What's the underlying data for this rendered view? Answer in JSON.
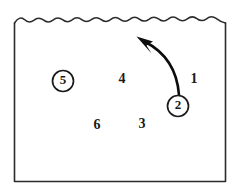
{
  "figure": {
    "type": "line-art-diagram",
    "background_color": "#ffffff",
    "stroke_color": "#2b2b2b",
    "ink_color": "#0d0d0d",
    "frame": {
      "left": 14,
      "right": 226,
      "top": 22,
      "bottom": 182,
      "top_edge_style": "wavy",
      "wave_count": 11,
      "wave_amplitude": 3.5
    },
    "labels": [
      {
        "id": "label-1",
        "text": "1",
        "x": 194,
        "y": 80,
        "circled": false
      },
      {
        "id": "label-3",
        "text": "3",
        "x": 142,
        "y": 125,
        "circled": false
      },
      {
        "id": "label-4",
        "text": "4",
        "x": 122,
        "y": 80,
        "circled": false
      },
      {
        "id": "label-6",
        "text": "6",
        "x": 97,
        "y": 126,
        "circled": false
      }
    ],
    "circled_labels": [
      {
        "id": "circled-label-5",
        "text": "5",
        "cx": 63,
        "cy": 81,
        "r": 10.5,
        "circled": true
      },
      {
        "id": "circled-label-2",
        "text": "2",
        "cx": 178,
        "cy": 106,
        "r": 10.5,
        "circled": true
      }
    ],
    "arrow": {
      "id": "curved-arrow",
      "from_label": "2",
      "direction": "up-left",
      "tail_x": 179,
      "tail_y": 95,
      "tip_x": 139,
      "tip_y": 39,
      "path": "M 179 95 C 177 74, 168 54, 142 42",
      "head_points": "139,38 152,41 147,45 152,51"
    }
  }
}
